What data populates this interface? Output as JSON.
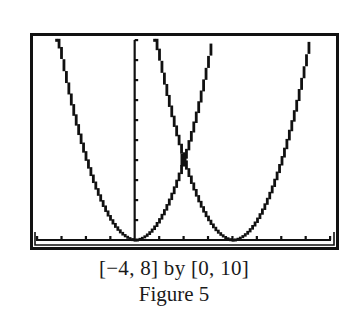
{
  "chart_data": {
    "type": "line",
    "title": "",
    "xlabel": "",
    "ylabel": "",
    "xlim": [
      -4,
      8
    ],
    "ylim": [
      0,
      10
    ],
    "xscl": 1,
    "yscl": 1,
    "grid": false,
    "legend": null,
    "series": [
      {
        "name": "y = x^2",
        "function": "x^2",
        "vertex": [
          0,
          0
        ]
      },
      {
        "name": "y = (x - 4)^2",
        "function": "(x-4)^2",
        "vertex": [
          4,
          0
        ]
      }
    ],
    "annotations": [
      {
        "label": "intersection",
        "x": 2,
        "y": 4
      }
    ],
    "window_text": "[−4, 8] by [0, 10]",
    "caption": "Figure 5"
  },
  "colors": {
    "ink": "#111111",
    "background": "#ffffff"
  },
  "captions": {
    "window": "[−4, 8] by [0, 10]",
    "figure": "Figure 5"
  }
}
